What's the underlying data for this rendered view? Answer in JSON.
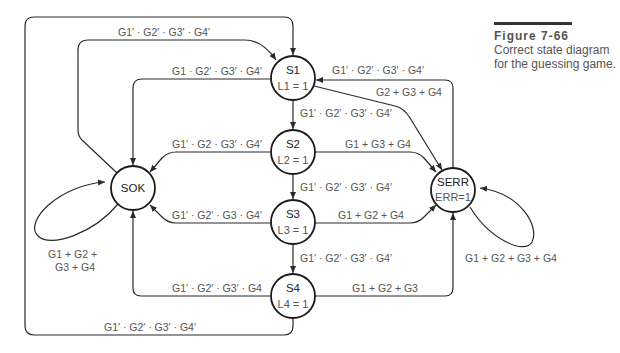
{
  "caption": {
    "figure_number": "Figure 7-66",
    "description": "Correct state diagram for the guessing game."
  },
  "states": {
    "S1": {
      "name": "S1",
      "output": "L1 = 1"
    },
    "S2": {
      "name": "S2",
      "output": "L2 = 1"
    },
    "S3": {
      "name": "S3",
      "output": "L3 = 1"
    },
    "S4": {
      "name": "S4",
      "output": "L4 = 1"
    },
    "SOK": {
      "name": "SOK",
      "output": ""
    },
    "SERR": {
      "name": "SERR",
      "output": "ERR=1"
    }
  },
  "transitions": {
    "sok_to_s1": "G1′ · G2′ · G3′ · G4′",
    "s1_to_sok": "G1 · G2′ · G3′ · G4′",
    "serr_to_s1": "G1′ · G2′ · G3′ · G4′",
    "s1_to_serr": "G2 + G3 + G4",
    "s1_to_s2": "G1′ · G2′ · G3′ · G4′",
    "s2_to_sok": "G1′ · G2 · G3′ · G4′",
    "s2_to_serr": "G1 + G3 + G4",
    "s2_to_s3": "G1′ · G2′ · G3′ · G4′",
    "s3_to_sok": "G1′ · G2′ · G3 · G4′",
    "s3_to_serr": "G1 + G2 + G4",
    "s3_to_s4": "G1′ · G2′ · G3′ · G4′",
    "s4_to_sok": "G1′ · G2′ · G3′ · G4",
    "s4_to_serr": "G1 + G2 + G3",
    "s4_to_s1": "G1′ · G2′ · G3′ · G4′",
    "sok_self_line1": "G1 + G2 +",
    "sok_self_line2": "G3 + G4",
    "serr_self": "G1 + G2 + G3 + G4"
  }
}
